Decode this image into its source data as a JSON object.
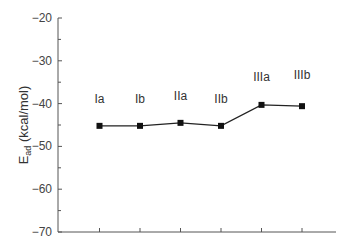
{
  "chart_data": {
    "type": "line",
    "title": "",
    "xlabel": "",
    "ylabel": "E_ad (kcal/mol)",
    "ylabel_main": "E",
    "ylabel_sub": "ad",
    "ylabel_unit": " (kcal/mol)",
    "ylim": [
      -70,
      -20
    ],
    "yticks": [
      -20,
      -30,
      -40,
      -50,
      -60,
      -70
    ],
    "ytick_labels": [
      "−20",
      "−30",
      "−40",
      "−50",
      "−60",
      "−70"
    ],
    "categories": [
      "Ia",
      "Ib",
      "IIa",
      "IIb",
      "IIIa",
      "IIIb"
    ],
    "series": [
      {
        "name": "E_ad",
        "values": [
          -45.2,
          -45.2,
          -44.5,
          -45.2,
          -40.3,
          -40.6
        ],
        "marker": "square",
        "color": "#111111"
      }
    ],
    "grid": false,
    "legend": null,
    "annotations": [
      {
        "text": "Ia",
        "category": "Ia"
      },
      {
        "text": "Ib",
        "category": "Ib"
      },
      {
        "text": "IIa",
        "category": "IIa"
      },
      {
        "text": "IIb",
        "category": "IIb"
      },
      {
        "text": "IIIa",
        "category": "IIIa"
      },
      {
        "text": "IIIb",
        "category": "IIIb"
      }
    ]
  }
}
